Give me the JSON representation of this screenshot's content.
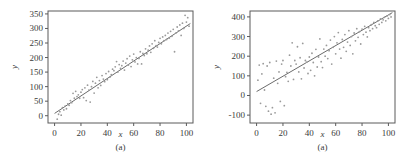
{
  "figure": {
    "panels": [
      {
        "id": "left",
        "caption": "(a)",
        "chart_data": {
          "type": "scatter",
          "title": "",
          "xlabel": "x",
          "ylabel": "y",
          "xlim": [
            -5,
            105
          ],
          "ylim": [
            -25,
            360
          ],
          "xticks": [
            0,
            20,
            40,
            60,
            80,
            100
          ],
          "yticks": [
            0,
            50,
            100,
            150,
            200,
            250,
            300,
            350
          ],
          "xticklabels": [
            "0",
            "20",
            "40",
            "60",
            "80",
            "100"
          ],
          "yticklabels": [
            "0",
            "50",
            "100",
            "150",
            "200",
            "250",
            "300",
            "350"
          ],
          "grid": false,
          "legend": null,
          "marker": "dot",
          "marker_color": "#9a9a9a",
          "line_color": "#6b6b6b",
          "fit_line": {
            "intercept": 8,
            "slope": 3.0,
            "x_start": 0,
            "x_end": 103
          },
          "points": [
            [
              2,
              -12
            ],
            [
              3,
              5
            ],
            [
              4,
              14
            ],
            [
              5,
              2
            ],
            [
              6,
              28
            ],
            [
              7,
              20
            ],
            [
              8,
              33
            ],
            [
              9,
              24
            ],
            [
              10,
              41
            ],
            [
              11,
              36
            ],
            [
              12,
              52
            ],
            [
              13,
              45
            ],
            [
              14,
              77
            ],
            [
              15,
              60
            ],
            [
              16,
              84
            ],
            [
              17,
              66
            ],
            [
              18,
              72
            ],
            [
              19,
              60
            ],
            [
              20,
              81
            ],
            [
              21,
              90
            ],
            [
              22,
              62
            ],
            [
              23,
              96
            ],
            [
              24,
              52
            ],
            [
              25,
              105
            ],
            [
              26,
              88
            ],
            [
              27,
              47
            ],
            [
              28,
              100
            ],
            [
              29,
              118
            ],
            [
              30,
              78
            ],
            [
              31,
              112
            ],
            [
              32,
              132
            ],
            [
              33,
              96
            ],
            [
              34,
              121
            ],
            [
              35,
              104
            ],
            [
              36,
              138
            ],
            [
              37,
              126
            ],
            [
              38,
              117
            ],
            [
              39,
              145
            ],
            [
              40,
              124
            ],
            [
              41,
              152
            ],
            [
              42,
              133
            ],
            [
              43,
              141
            ],
            [
              44,
              160
            ],
            [
              45,
              155
            ],
            [
              46,
              168
            ],
            [
              47,
              186
            ],
            [
              48,
              150
            ],
            [
              49,
              176
            ],
            [
              50,
              163
            ],
            [
              51,
              172
            ],
            [
              52,
              188
            ],
            [
              53,
              157
            ],
            [
              54,
              181
            ],
            [
              55,
              196
            ],
            [
              56,
              174
            ],
            [
              57,
              205
            ],
            [
              58,
              169
            ],
            [
              59,
              192
            ],
            [
              60,
              212
            ],
            [
              61,
              185
            ],
            [
              62,
              200
            ],
            [
              63,
              178
            ],
            [
              64,
              197
            ],
            [
              65,
              220
            ],
            [
              66,
              178
            ],
            [
              67,
              214
            ],
            [
              68,
              207
            ],
            [
              69,
              230
            ],
            [
              70,
              213
            ],
            [
              71,
              225
            ],
            [
              72,
              240
            ],
            [
              73,
              218
            ],
            [
              74,
              247
            ],
            [
              75,
              232
            ],
            [
              76,
              258
            ],
            [
              77,
              241
            ],
            [
              78,
              236
            ],
            [
              79,
              252
            ],
            [
              80,
              266
            ],
            [
              81,
              247
            ],
            [
              82,
              271
            ],
            [
              83,
              258
            ],
            [
              84,
              276
            ],
            [
              85,
              262
            ],
            [
              86,
              284
            ],
            [
              87,
              267
            ],
            [
              88,
              290
            ],
            [
              89,
              273
            ],
            [
              90,
              297
            ],
            [
              91,
              220
            ],
            [
              92,
              284
            ],
            [
              93,
              305
            ],
            [
              94,
              292
            ],
            [
              95,
              312
            ],
            [
              96,
              276
            ],
            [
              97,
              318
            ],
            [
              98,
              300
            ],
            [
              99,
              345
            ],
            [
              100,
              322
            ],
            [
              101,
              337
            ],
            [
              102,
              308
            ]
          ]
        }
      },
      {
        "id": "right",
        "caption": "(a)",
        "chart_data": {
          "type": "scatter",
          "title": "",
          "xlabel": "x",
          "ylabel": "y",
          "xlim": [
            -5,
            105
          ],
          "ylim": [
            -140,
            430
          ],
          "xticks": [
            0,
            20,
            40,
            60,
            80,
            100
          ],
          "yticks": [
            -100,
            0,
            100,
            200,
            300,
            400
          ],
          "xticklabels": [
            "0",
            "20",
            "40",
            "60",
            "80",
            "100"
          ],
          "yticklabels": [
            "-100",
            "0",
            "100",
            "200",
            "300",
            "400"
          ],
          "grid": false,
          "legend": null,
          "marker": "dot",
          "marker_color": "#9a9a9a",
          "line_color": "#6b6b6b",
          "fit_line": {
            "intercept": 20,
            "slope": 3.9,
            "x_start": 0,
            "x_end": 103
          },
          "points": [
            [
              1,
              78
            ],
            [
              2,
              155
            ],
            [
              3,
              -40
            ],
            [
              4,
              110
            ],
            [
              5,
              162
            ],
            [
              6,
              28
            ],
            [
              7,
              -55
            ],
            [
              8,
              150
            ],
            [
              9,
              -80
            ],
            [
              10,
              168
            ],
            [
              11,
              -95
            ],
            [
              12,
              -62
            ],
            [
              13,
              88
            ],
            [
              14,
              -88
            ],
            [
              15,
              175
            ],
            [
              16,
              62
            ],
            [
              17,
              120
            ],
            [
              18,
              -30
            ],
            [
              19,
              160
            ],
            [
              20,
              178
            ],
            [
              21,
              -52
            ],
            [
              22,
              96
            ],
            [
              23,
              118
            ],
            [
              24,
              72
            ],
            [
              25,
              205
            ],
            [
              26,
              150
            ],
            [
              27,
              268
            ],
            [
              28,
              82
            ],
            [
              29,
              178
            ],
            [
              30,
              160
            ],
            [
              31,
              248
            ],
            [
              32,
              120
            ],
            [
              33,
              192
            ],
            [
              34,
              85
            ],
            [
              35,
              265
            ],
            [
              36,
              140
            ],
            [
              37,
              178
            ],
            [
              38,
              170
            ],
            [
              39,
              112
            ],
            [
              40,
              196
            ],
            [
              41,
              128
            ],
            [
              42,
              215
            ],
            [
              43,
              168
            ],
            [
              44,
              100
            ],
            [
              45,
              235
            ],
            [
              46,
              145
            ],
            [
              47,
              196
            ],
            [
              48,
              288
            ],
            [
              49,
              172
            ],
            [
              50,
              142
            ],
            [
              51,
              236
            ],
            [
              52,
              200
            ],
            [
              53,
              255
            ],
            [
              54,
              188
            ],
            [
              55,
              228
            ],
            [
              56,
              282
            ],
            [
              57,
              160
            ],
            [
              58,
              245
            ],
            [
              59,
              300
            ],
            [
              60,
              212
            ],
            [
              61,
              268
            ],
            [
              62,
              320
            ],
            [
              63,
              236
            ],
            [
              64,
              190
            ],
            [
              65,
              285
            ],
            [
              66,
              245
            ],
            [
              67,
              310
            ],
            [
              68,
              225
            ],
            [
              69,
              272
            ],
            [
              70,
              330
            ],
            [
              71,
              255
            ],
            [
              72,
              300
            ],
            [
              73,
              212
            ],
            [
              74,
              318
            ],
            [
              75,
              278
            ],
            [
              76,
              340
            ],
            [
              77,
              296
            ],
            [
              78,
              325
            ],
            [
              79,
              262
            ],
            [
              80,
              338
            ],
            [
              81,
              310
            ],
            [
              82,
              352
            ],
            [
              83,
              322
            ],
            [
              84,
              298
            ],
            [
              85,
              345
            ],
            [
              86,
              330
            ],
            [
              87,
              360
            ],
            [
              88,
              340
            ],
            [
              89,
              372
            ],
            [
              90,
              355
            ],
            [
              91,
              345
            ],
            [
              92,
              380
            ],
            [
              93,
              362
            ],
            [
              94,
              390
            ],
            [
              95,
              372
            ],
            [
              96,
              385
            ],
            [
              97,
              398
            ],
            [
              98,
              380
            ],
            [
              99,
              405
            ],
            [
              100,
              392
            ],
            [
              101,
              412
            ],
            [
              102,
              400
            ]
          ]
        }
      }
    ]
  }
}
